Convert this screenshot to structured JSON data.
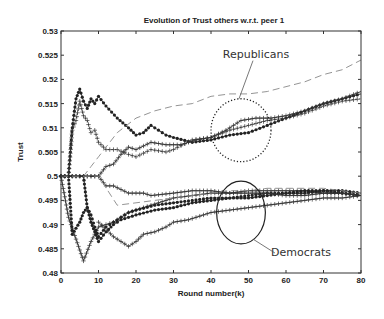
{
  "chart_data": {
    "type": "line",
    "title": "Evolution of Trust others w.r.t. peer 1",
    "xlabel": "Round number(k)",
    "ylabel": "Trust",
    "xlim": [
      0,
      80
    ],
    "ylim": [
      0.48,
      0.53
    ],
    "xticks": [
      0,
      10,
      20,
      30,
      40,
      50,
      60,
      70,
      80
    ],
    "yticks": [
      0.48,
      0.485,
      0.49,
      0.495,
      0.5,
      0.505,
      0.51,
      0.515,
      0.52,
      0.525,
      0.53
    ],
    "ytick_labels": [
      "0.48",
      "0.485",
      "0.49",
      "0.495",
      "0.5",
      "0.505",
      "0.51",
      "0.515",
      "0.52",
      "0.525",
      "0.53"
    ],
    "grid": false,
    "annotations": [
      {
        "text": "Republicans",
        "x": 52,
        "y": 0.5245,
        "ellipse": {
          "cx": 48,
          "cy": 0.5095,
          "rx": 8,
          "ry": 0.0065,
          "style": "dotted"
        }
      },
      {
        "text": "Democrats",
        "x": 64,
        "y": 0.4835,
        "ellipse": {
          "cx": 48,
          "cy": 0.4925,
          "rx": 6.5,
          "ry": 0.0065,
          "style": "solid"
        }
      }
    ],
    "series": [
      {
        "name": "Republican A (dots, solid)",
        "group": "Republicans",
        "marker": "dot",
        "dash": "solid",
        "x": [
          0,
          2,
          3,
          4,
          5,
          6,
          7,
          8,
          9,
          10,
          12,
          15,
          18,
          20,
          22,
          24,
          26,
          28,
          30,
          35,
          40,
          45,
          50,
          55,
          60,
          65,
          70,
          75,
          80
        ],
        "y": [
          0.5,
          0.5,
          0.51,
          0.516,
          0.518,
          0.5155,
          0.514,
          0.516,
          0.515,
          0.5165,
          0.5145,
          0.512,
          0.51,
          0.5085,
          0.509,
          0.5105,
          0.5095,
          0.5085,
          0.508,
          0.507,
          0.5075,
          0.5085,
          0.509,
          0.5105,
          0.512,
          0.5135,
          0.515,
          0.516,
          0.517
        ]
      },
      {
        "name": "Republican B (plus, dotted)",
        "group": "Republicans",
        "marker": "plus",
        "dash": "dotted",
        "x": [
          0,
          2,
          3,
          4,
          5,
          6,
          7,
          8,
          9,
          10,
          12,
          15,
          18,
          20,
          24,
          28,
          30,
          35,
          40,
          45,
          50,
          55,
          60,
          65,
          70,
          75,
          80
        ],
        "y": [
          0.5,
          0.5,
          0.5095,
          0.5115,
          0.5155,
          0.5125,
          0.5115,
          0.509,
          0.5095,
          0.507,
          0.5055,
          0.5055,
          0.5045,
          0.504,
          0.5055,
          0.505,
          0.5055,
          0.5075,
          0.508,
          0.5095,
          0.5105,
          0.5115,
          0.512,
          0.513,
          0.5145,
          0.5155,
          0.516
        ]
      },
      {
        "name": "Republican C (plus, solid)",
        "group": "Republicans",
        "marker": "plus",
        "dash": "solid",
        "x": [
          0,
          5,
          8,
          10,
          12,
          14,
          16,
          18,
          20,
          24,
          28,
          32,
          36,
          40,
          44,
          48,
          52,
          56,
          60,
          65,
          70,
          75,
          80
        ],
        "y": [
          0.5,
          0.5,
          0.5,
          0.5,
          0.502,
          0.5025,
          0.5045,
          0.506,
          0.5055,
          0.507,
          0.5065,
          0.5065,
          0.5075,
          0.508,
          0.5095,
          0.5115,
          0.512,
          0.512,
          0.5125,
          0.5135,
          0.515,
          0.516,
          0.5175
        ]
      },
      {
        "name": "Republican D (dashed)",
        "group": "Republicans",
        "marker": "none",
        "dash": "dashed",
        "x": [
          0,
          6,
          8,
          10,
          15,
          20,
          25,
          30,
          35,
          40,
          45,
          50,
          55,
          60,
          65,
          70,
          75,
          80
        ],
        "y": [
          0.5,
          0.5,
          0.502,
          0.504,
          0.509,
          0.512,
          0.5135,
          0.5145,
          0.515,
          0.5165,
          0.517,
          0.517,
          0.5175,
          0.5185,
          0.5195,
          0.521,
          0.522,
          0.524
        ]
      },
      {
        "name": "Democrat A (plus, solid)",
        "group": "Democrats",
        "marker": "plus",
        "dash": "solid",
        "x": [
          0,
          2,
          4,
          6,
          8,
          10,
          14,
          18,
          22,
          26,
          30,
          35,
          40,
          45,
          50,
          55,
          60,
          65,
          70,
          75,
          80
        ],
        "y": [
          0.5,
          0.4915,
          0.487,
          0.4825,
          0.4865,
          0.4895,
          0.4905,
          0.4925,
          0.4935,
          0.4945,
          0.4955,
          0.496,
          0.4965,
          0.4965,
          0.497,
          0.497,
          0.497,
          0.497,
          0.4965,
          0.4965,
          0.496
        ]
      },
      {
        "name": "Democrat B (dots, dotted)",
        "group": "Democrats",
        "marker": "dot",
        "dash": "dotted",
        "x": [
          0,
          2,
          3,
          5,
          6,
          7,
          8,
          9,
          10,
          12,
          14,
          16,
          18,
          20,
          25,
          30,
          35,
          40,
          45,
          50,
          55,
          60,
          65,
          70,
          75,
          80
        ],
        "y": [
          0.5,
          0.5,
          0.488,
          0.4905,
          0.4925,
          0.4935,
          0.492,
          0.4895,
          0.4875,
          0.4895,
          0.4905,
          0.4915,
          0.4925,
          0.493,
          0.494,
          0.4945,
          0.495,
          0.4955,
          0.4955,
          0.496,
          0.4965,
          0.4965,
          0.497,
          0.497,
          0.4965,
          0.496
        ]
      },
      {
        "name": "Democrat C (dots, solid)",
        "group": "Democrats",
        "marker": "dot",
        "dash": "solid",
        "x": [
          0,
          6,
          7,
          8,
          9,
          10,
          12,
          14,
          16,
          18,
          20,
          25,
          30,
          35,
          40,
          45,
          50,
          55,
          60,
          65,
          70,
          75,
          80
        ],
        "y": [
          0.5,
          0.5,
          0.4935,
          0.4905,
          0.4885,
          0.4865,
          0.4885,
          0.49,
          0.491,
          0.4915,
          0.492,
          0.493,
          0.4935,
          0.4945,
          0.495,
          0.4955,
          0.4955,
          0.496,
          0.4965,
          0.4965,
          0.497,
          0.497,
          0.4965
        ]
      },
      {
        "name": "Democrat D (plus, solid flat)",
        "group": "Democrats",
        "marker": "plus",
        "dash": "solid",
        "x": [
          0,
          5,
          10,
          12,
          14,
          18,
          20,
          22,
          24,
          30,
          35,
          40,
          45,
          50,
          55,
          60,
          65,
          70,
          75,
          80
        ],
        "y": [
          0.5,
          0.5,
          0.5,
          0.498,
          0.498,
          0.4965,
          0.4965,
          0.4965,
          0.496,
          0.4965,
          0.497,
          0.497,
          0.4965,
          0.4965,
          0.4965,
          0.496,
          0.496,
          0.4965,
          0.4965,
          0.496
        ]
      },
      {
        "name": "Democrat E (dashed)",
        "group": "Democrats",
        "marker": "none",
        "dash": "dashed",
        "x": [
          0,
          10,
          15,
          20,
          25,
          30,
          35,
          40,
          45,
          50,
          55,
          60,
          65,
          70,
          75,
          80
        ],
        "y": [
          0.5,
          0.5,
          0.494,
          0.4945,
          0.495,
          0.4955,
          0.496,
          0.4965,
          0.497,
          0.497,
          0.4975,
          0.4975,
          0.4975,
          0.4975,
          0.497,
          0.4965
        ]
      },
      {
        "name": "Democrat F (plus, solid low)",
        "group": "Democrats",
        "marker": "plus",
        "dash": "solid",
        "x": [
          10,
          14,
          18,
          20,
          22,
          25,
          28,
          30,
          34,
          38,
          40,
          45,
          50,
          55,
          60,
          65,
          70,
          75,
          80
        ],
        "y": [
          0.4905,
          0.4875,
          0.4855,
          0.4865,
          0.488,
          0.4885,
          0.4895,
          0.4905,
          0.491,
          0.492,
          0.4925,
          0.493,
          0.4935,
          0.494,
          0.4945,
          0.495,
          0.4955,
          0.4955,
          0.496
        ]
      }
    ]
  },
  "plot": {
    "left": 61,
    "right": 361,
    "top": 31,
    "bottom": 273
  }
}
